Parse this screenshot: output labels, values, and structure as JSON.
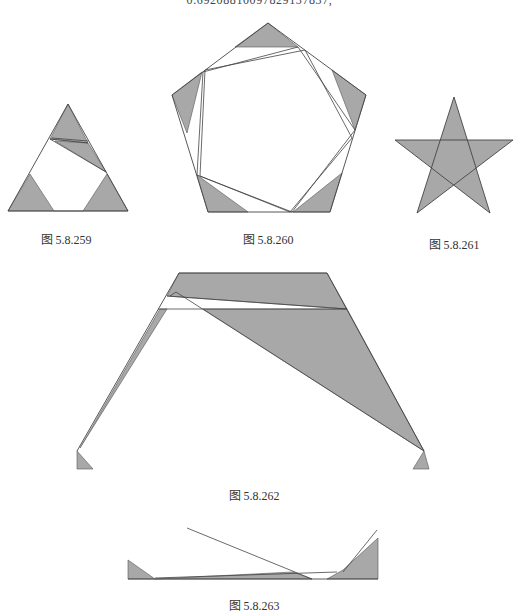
{
  "top_text": "0.69208810097829137837,",
  "colors": {
    "shade": "#a8a8a8",
    "line": "#444444"
  },
  "figures": [
    {
      "caption": "图 5.8.259",
      "outline": "68,104 8,211 128,211",
      "shaded": [
        "68,104 50,139 88,143",
        "55,141 88,143 106,172",
        "30,174 8,211 54,211",
        "107,174 83,211 128,211"
      ],
      "lines": [
        "50,139 106,172",
        "52,138 88,141",
        "50,139 88,143",
        "54,211 83,211"
      ]
    },
    {
      "caption": "图 5.8.260",
      "outline": "268,23 366,95 330,212 208,212 172,95",
      "shaded": [
        "268,23 235,47 298,47",
        "366,95 332,70 355,130",
        "330,212 342,173 293,212",
        "208,212 197,175 248,212",
        "172,95 202,72 187,133"
      ],
      "lines": [
        "203,72 298,47 355,130 292,212 197,175",
        "205,70 305,50 352,138 290,212 200,176"
      ]
    },
    {
      "caption": "图 5.8.261",
      "star": "454,97 417,213 513,140 395,140 490,213"
    },
    {
      "caption": "图 5.8.262",
      "outline": "179,273 327,273 424,451",
      "outline_left": "179,273 77,451",
      "shaded": [
        "179,273 327,273 347,309 167,296",
        "203,309 347,309 424,451",
        "160,309 167,309 80,448",
        "77,451 77,469 93,469",
        "424,451 413,469 429,469"
      ],
      "lines": [
        "176,292 424,451",
        "158,309 347,309",
        "167,296 347,309",
        "170,296 176,292"
      ]
    },
    {
      "caption": "图 5.8.263",
      "shaded": [
        "128,560 128,579 155,579",
        "155,579 293,572 312,579",
        "327,579 343,570 378,538 378,579"
      ],
      "lines": [
        "128,579 378,579",
        "187,528 312,579",
        "155,578 337,572",
        "343,572 377,530"
      ]
    }
  ]
}
